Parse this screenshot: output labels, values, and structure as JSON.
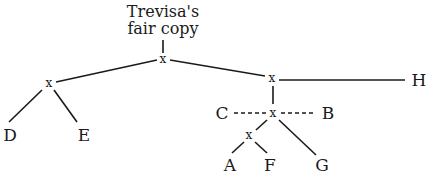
{
  "diagram": {
    "type": "stemma",
    "title_line1": "Trevisa's",
    "title_line2": "fair copy",
    "hyparchetype_marker": "x",
    "witnesses": {
      "D": "D",
      "E": "E",
      "H": "H",
      "C": "C",
      "B": "B",
      "A": "A",
      "F": "F",
      "G": "G"
    },
    "edges": [
      {
        "from": "fair copy",
        "to": "x1",
        "style": "solid"
      },
      {
        "from": "x1",
        "to": "x2",
        "style": "solid"
      },
      {
        "from": "x2",
        "to": "D",
        "style": "solid"
      },
      {
        "from": "x2",
        "to": "E",
        "style": "solid"
      },
      {
        "from": "x1",
        "to": "x3",
        "style": "solid"
      },
      {
        "from": "x3",
        "to": "H",
        "style": "solid"
      },
      {
        "from": "x3",
        "to": "x4",
        "style": "solid"
      },
      {
        "from": "x4",
        "to": "C",
        "style": "dashed"
      },
      {
        "from": "x4",
        "to": "B",
        "style": "dashed"
      },
      {
        "from": "x4",
        "to": "x5",
        "style": "solid"
      },
      {
        "from": "x4",
        "to": "G",
        "style": "solid"
      },
      {
        "from": "x5",
        "to": "A",
        "style": "solid"
      },
      {
        "from": "x5",
        "to": "F",
        "style": "solid"
      }
    ]
  }
}
